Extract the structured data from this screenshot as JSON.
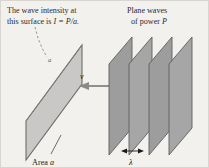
{
  "figure": {
    "name": "wave-intensity-plane-waves-diagram",
    "background_color": "#f2f1ee",
    "border_color": "#d8d6d1"
  },
  "captions": {
    "intensity_line1": "The wave intensity at",
    "intensity_line2_prefix": "this surface is ",
    "intensity_line2_math": "I = P/a.",
    "plane_waves_line1": "Plane waves",
    "plane_waves_line2_prefix": "of power ",
    "plane_waves_line2_math": "P",
    "area_label_prefix": "Area ",
    "area_label_math": "a",
    "wavelength_label": "λ"
  },
  "labels": {
    "velocity": "v",
    "surface_area_small": "a"
  },
  "surface": {
    "name": "intensity-surface",
    "fill": "#c9c8c6",
    "stroke": "#6e6d6b",
    "points": "25,120 45,80 81,44 81,82 62,121 25,148"
  },
  "wave_planes": {
    "fill": "#9e9e9e",
    "fill_edge": "#b4b4b4",
    "stroke": "#5d5d5d",
    "count": 4,
    "sheets": [
      {
        "points": "110,62 133,36 133,126 110,152"
      },
      {
        "points": "130,62 153,36 153,126 130,152"
      },
      {
        "points": "150,62 173,36 173,126 150,152"
      },
      {
        "points": "170,62 193,36 193,126 170,152"
      }
    ]
  },
  "arrows": {
    "velocity_arrow": {
      "name": "velocity-arrow",
      "from_x": 132,
      "to_x": 82,
      "y": 85
    },
    "wavelength_arrow": {
      "name": "wavelength-arrow",
      "from_x": 122,
      "to_x": 141,
      "y": 150
    }
  },
  "leaders": {
    "dashed_leader": {
      "name": "intensity-dashed-leader",
      "d": "M34,24 L37,36 L40,46 L45,56"
    },
    "area_leader": {
      "name": "area-leader-line",
      "d": "M59,136 L49,155"
    }
  }
}
